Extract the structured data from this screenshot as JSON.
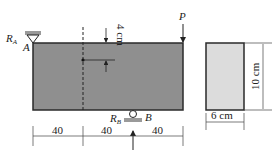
{
  "beam": {
    "fill": "#8f8f8f",
    "stroke": "#2a2a2a",
    "support_a_label": "R",
    "support_a_sub": "A",
    "point_a": "A",
    "support_b_label": "R",
    "support_b_sub": "B",
    "point_b": "B",
    "load_label": "P",
    "top_offset_label": "4 cm"
  },
  "dimensions": {
    "spans": [
      "40",
      "40",
      "40"
    ]
  },
  "cross_section": {
    "fill": "#dcdcdc",
    "width_label": "6 cm",
    "height_label": "10 cm"
  }
}
